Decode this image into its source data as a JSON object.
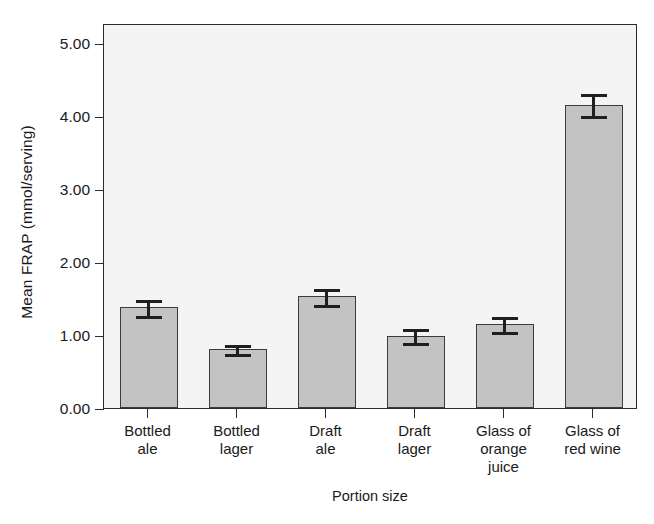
{
  "chart_data": {
    "type": "bar",
    "title": "",
    "xlabel": "Portion size",
    "ylabel": "Mean FRAP (mmol/serving)",
    "categories": [
      "Bottled\nale",
      "Bottled\nlager",
      "Draft\nale",
      "Draft\nlager",
      "Glass of\norange\njuice",
      "Glass of\nred wine"
    ],
    "categories_flat": [
      "Bottled ale",
      "Bottled lager",
      "Draft ale",
      "Draft lager",
      "Glass of orange juice",
      "Glass of red wine"
    ],
    "values": [
      1.38,
      0.81,
      1.53,
      0.99,
      1.15,
      4.15
    ],
    "errors": [
      0.13,
      0.08,
      0.13,
      0.12,
      0.12,
      0.17
    ],
    "series": [
      {
        "name": "Mean FRAP",
        "values": [
          1.38,
          0.81,
          1.53,
          0.99,
          1.15,
          4.15
        ],
        "errors": [
          0.13,
          0.08,
          0.13,
          0.12,
          0.12,
          0.17
        ]
      }
    ],
    "ylim": [
      0.0,
      5.27
    ],
    "yticks": [
      0.0,
      1.0,
      2.0,
      3.0,
      4.0,
      5.0
    ],
    "ytick_labels": [
      "0.00",
      "1.00",
      "2.00",
      "3.00",
      "4.00",
      "5.00"
    ],
    "grid": false,
    "legend": false,
    "legend_position": "none",
    "error_bar_style": "capped",
    "colors": {
      "bar_fill": "#c3c3c3",
      "bar_edge": "#3a3a3a",
      "error_bar": "#1f1f1f",
      "plot_background": "#f4f4f4",
      "frame": "#2b2b2b",
      "text": "#1a1a1a",
      "figure_background": "#ffffff"
    }
  }
}
